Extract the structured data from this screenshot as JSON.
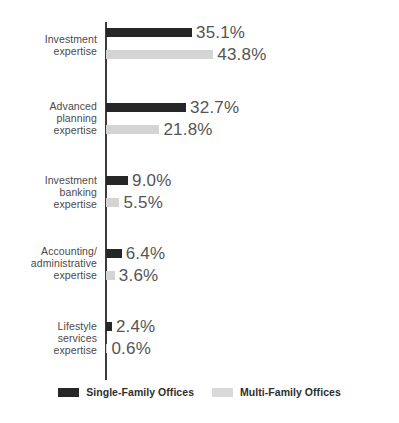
{
  "chart_data": {
    "type": "bar",
    "orientation": "horizontal",
    "title": "",
    "xlabel": "",
    "ylabel": "",
    "grid": false,
    "legend_position": "bottom-center",
    "xlim": [
      0,
      50
    ],
    "categories": [
      "Investment\nexpertise",
      "Advanced\nplanning\nexpertise",
      "Investment\nbanking\nexpertise",
      "Accounting/\nadministrative\nexpertise",
      "Lifestyle\nservices\nexpertise"
    ],
    "series": [
      {
        "name": "Single-Family Offices",
        "color": "#262626",
        "values": [
          35.1,
          32.7,
          9.0,
          6.4,
          2.4
        ],
        "labels": [
          "35.1%",
          "32.7%",
          "9.0%",
          "6.4%",
          "2.4%"
        ]
      },
      {
        "name": "Multi-Family Offices",
        "color": "#d4d4d4",
        "values": [
          43.8,
          21.8,
          5.5,
          3.6,
          0.6
        ],
        "labels": [
          "43.8%",
          "21.8%",
          "5.5%",
          "3.6%",
          "0.6%"
        ]
      }
    ]
  },
  "legend": {
    "items": [
      {
        "label": "Single-Family Offices",
        "swatch": "dark"
      },
      {
        "label": "Multi-Family Offices",
        "swatch": "light"
      }
    ]
  }
}
